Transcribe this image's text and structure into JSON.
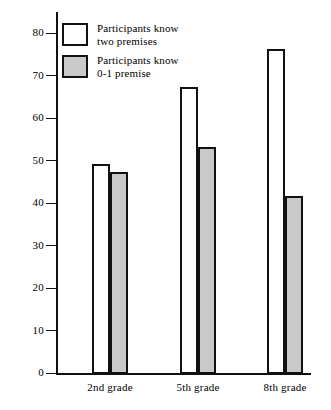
{
  "chart_data": {
    "type": "bar",
    "title": "",
    "subtitle": "",
    "xlabel": "",
    "ylabel": "",
    "categories": [
      "2nd grade",
      "5th grade",
      "8th grade"
    ],
    "series": [
      {
        "name": "Participants know two premises",
        "values": [
          49.5,
          67.5,
          76.5
        ],
        "fill": "#ffffff",
        "stroke": "#111111"
      },
      {
        "name": "Participants know 0-1 premise",
        "values": [
          47.5,
          53.5,
          42.0
        ],
        "fill": "#c9c9c9",
        "stroke": "#111111"
      }
    ],
    "ylim": [
      0,
      85
    ],
    "yticks": [
      0,
      10,
      20,
      30,
      40,
      50,
      60,
      70,
      80
    ],
    "ytick_labels": [
      "0",
      "10",
      "20",
      "30",
      "40",
      "50",
      "60",
      "70",
      "80"
    ],
    "grid": false,
    "legend_position": "upper-left"
  },
  "legend": {
    "items": [
      {
        "label_line1": "Participants know",
        "label_line2": "two premises",
        "swatch": "white-square-icon"
      },
      {
        "label_line1": "Participants know",
        "label_line2": "0-1 premise",
        "swatch": "grey-square-icon"
      }
    ]
  },
  "axes": {
    "y_tick_labels": [
      "80",
      "70",
      "60",
      "50",
      "40",
      "30",
      "20",
      "10",
      "0"
    ],
    "x_category_labels": [
      "2nd grade",
      "5th grade",
      "8th grade"
    ]
  },
  "colors": {
    "bar_known_two": "#ffffff",
    "bar_known_partial": "#c9c9c9",
    "axis": "#111111",
    "background": "#ffffff"
  }
}
